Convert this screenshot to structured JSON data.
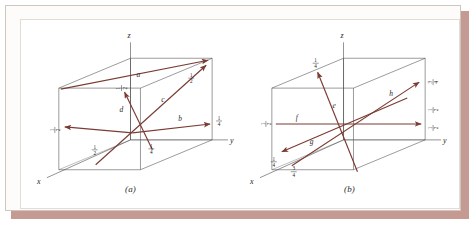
{
  "figure": {
    "panels": [
      {
        "id": "a",
        "caption": "(a)",
        "axes": {
          "x": "x",
          "y": "y",
          "z": "z"
        },
        "vectors": [
          {
            "name": "a",
            "label": "a"
          },
          {
            "name": "b",
            "label": "b"
          },
          {
            "name": "c",
            "label": "c"
          },
          {
            "name": "d",
            "label": "d"
          }
        ],
        "fractions": [
          {
            "name": "frac-a-z",
            "numerator": "1",
            "denominator": "2",
            "orientation": "vertical"
          },
          {
            "name": "frac-left-edge",
            "numerator": "1",
            "denominator": "2",
            "orientation": "vertical"
          },
          {
            "name": "frac-c-right",
            "numerator": "1",
            "denominator": "2",
            "orientation": "horizontal"
          },
          {
            "name": "frac-b-right",
            "numerator": "1",
            "denominator": "4",
            "orientation": "horizontal"
          },
          {
            "name": "frac-d-bottom-left",
            "numerator": "1",
            "denominator": "2",
            "orientation": "horizontal"
          },
          {
            "name": "frac-c-bottom",
            "numerator": "1",
            "denominator": "4",
            "orientation": "horizontal"
          }
        ]
      },
      {
        "id": "b",
        "caption": "(b)",
        "axes": {
          "x": "x",
          "y": "y",
          "z": "z"
        },
        "vectors": [
          {
            "name": "e",
            "label": "e"
          },
          {
            "name": "f",
            "label": "f"
          },
          {
            "name": "g",
            "label": "g"
          },
          {
            "name": "h",
            "label": "h"
          }
        ],
        "fractions": [
          {
            "name": "frac-e-top",
            "numerator": "1",
            "denominator": "4",
            "orientation": "horizontal"
          },
          {
            "name": "frac-f-left",
            "numerator": "1",
            "denominator": "2",
            "orientation": "vertical"
          },
          {
            "name": "frac-h-right-top",
            "numerator": "3",
            "denominator": "4",
            "orientation": "vertical"
          },
          {
            "name": "frac-right-mid",
            "numerator": "1",
            "denominator": "2",
            "orientation": "vertical"
          },
          {
            "name": "frac-right-low",
            "numerator": "1",
            "denominator": "2",
            "orientation": "vertical"
          },
          {
            "name": "frac-g-lower-left",
            "numerator": "1",
            "denominator": "4",
            "orientation": "horizontal"
          },
          {
            "name": "frac-x-lower-left",
            "numerator": "3",
            "denominator": "4",
            "orientation": "horizontal"
          }
        ]
      }
    ],
    "colors": {
      "vector": "#7a3b32",
      "edge": "#4a4a4a",
      "frame": "#cfc7bf",
      "shadow": "#c49a92",
      "background": "#ffffff"
    }
  }
}
